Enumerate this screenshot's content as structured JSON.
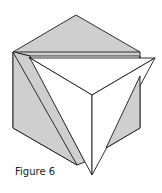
{
  "caption": "Figure 6",
  "colors": {
    "gray_face": "#cfcfcf",
    "white_face": "#ffffff",
    "stroke": "#1a1a1a"
  },
  "shapes": {
    "cube_top_face": "76,15 140,52 140,56 30,56 13,52",
    "cube_left_face": "13,52 30,56 85,162 77,165 13,128",
    "cube_right_wedge": "140,76 140,128 106,148",
    "front_triangle_left": "30,58 92,95 92,175 85,162",
    "front_triangle_top": "30,58 155,58 92,95",
    "front_triangle_right": "155,58 92,95 92,175"
  }
}
